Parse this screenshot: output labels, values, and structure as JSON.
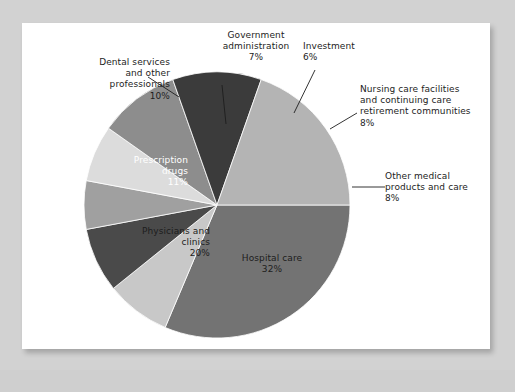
{
  "figure": {
    "background_color": "#d2d2d2",
    "card_color": "#ffffff"
  },
  "chart_data": {
    "type": "pie",
    "title": "",
    "subtitle": "",
    "xlabel": "",
    "ylabel": "",
    "legend_position": "none",
    "grid": false,
    "unit": "%",
    "total": 100,
    "start_angle_deg": 0,
    "direction": "clockwise",
    "categories": [
      "Hospital care",
      "Other medical products and care",
      "Nursing care facilities and continuing care retirement communities",
      "Investment",
      "Government administration",
      "Dental services and other professionals",
      "Prescription drugs",
      "Physicians and clinics"
    ],
    "values": [
      32,
      8,
      8,
      6,
      7,
      10,
      11,
      20
    ],
    "slices": [
      {
        "key": "hospital",
        "label": "Hospital care",
        "value": 32,
        "value_text": "32%",
        "color": "#737373",
        "label_placement": "inside",
        "label_color": "#1d1d1d",
        "label_text": "Hospital care\n32%"
      },
      {
        "key": "othermed",
        "label": "Other medical products and care",
        "value": 8,
        "value_text": "8%",
        "color": "#c8c8c8",
        "label_placement": "outside",
        "label_color": "#1d1d1d",
        "label_text": "Other medical\nproducts and care\n8%"
      },
      {
        "key": "nursing",
        "label": "Nursing care facilities and continuing care retirement communities",
        "value": 8,
        "value_text": "8%",
        "color": "#4a4a4a",
        "label_placement": "outside",
        "label_color": "#1d1d1d",
        "label_text": "Nursing care facilities\nand continuing care\nretirement communities\n8%"
      },
      {
        "key": "investment",
        "label": "Investment",
        "value": 6,
        "value_text": "6%",
        "color": "#a0a0a0",
        "label_placement": "outside",
        "label_color": "#1d1d1d",
        "label_text": "Investment\n6%"
      },
      {
        "key": "government",
        "label": "Government administration",
        "value": 7,
        "value_text": "7%",
        "color": "#dcdcdc",
        "label_placement": "outside",
        "label_color": "#1d1d1d",
        "label_text": "Government\nadministration\n7%"
      },
      {
        "key": "dental",
        "label": "Dental services and other professionals",
        "value": 10,
        "value_text": "10%",
        "color": "#8d8d8d",
        "label_placement": "outside",
        "label_color": "#1d1d1d",
        "label_text": "Dental services\nand other\nprofessionals\n10%"
      },
      {
        "key": "prescription",
        "label": "Prescription drugs",
        "value": 11,
        "value_text": "11%",
        "color": "#3b3b3b",
        "label_placement": "inside",
        "label_color": "#ffffff",
        "label_text": "Prescription\ndrugs\n11%"
      },
      {
        "key": "physicians",
        "label": "Physicians and clinics",
        "value": 20,
        "value_text": "20%",
        "color": "#b4b4b4",
        "label_placement": "inside",
        "label_color": "#1d1d1d",
        "label_text": "Physicians and\nclinics\n20%"
      }
    ]
  }
}
